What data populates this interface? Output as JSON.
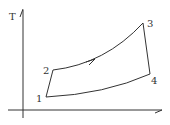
{
  "diagram": {
    "type": "T-s diagram (Brayton cycle)",
    "axis_y_label": "T",
    "axis_x_label": "",
    "points": [
      {
        "id": "1",
        "label": "1",
        "x": 46,
        "y": 97
      },
      {
        "id": "2",
        "label": "2",
        "x": 53,
        "y": 70
      },
      {
        "id": "3",
        "label": "3",
        "x": 143,
        "y": 23
      },
      {
        "id": "4",
        "label": "4",
        "x": 150,
        "y": 74
      }
    ],
    "processes": [
      {
        "from": "1",
        "to": "2",
        "shape": "straight"
      },
      {
        "from": "2",
        "to": "3",
        "shape": "curve",
        "direction_arrow": true
      },
      {
        "from": "3",
        "to": "4",
        "shape": "straight"
      },
      {
        "from": "4",
        "to": "1",
        "shape": "curve"
      }
    ],
    "colors": {
      "line": "#333333",
      "background": "#ffffff"
    }
  }
}
